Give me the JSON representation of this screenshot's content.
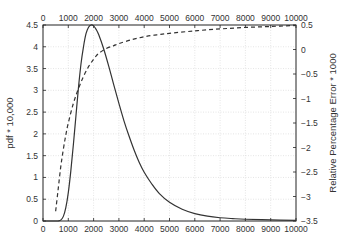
{
  "chart_data": {
    "type": "line",
    "title": "",
    "xlabel": "",
    "ylabel": "pdf * 10,000",
    "ylabel_right": "Relative Percentage Error * 1000",
    "xlim": [
      0,
      10000
    ],
    "ylim": [
      0,
      4.5
    ],
    "ylim_right": [
      -3.5,
      0.5
    ],
    "grid": true,
    "legend": null,
    "x_ticks": [
      "0",
      "1000",
      "2000",
      "3000",
      "4000",
      "5000",
      "6000",
      "7000",
      "8000",
      "9000",
      "10000"
    ],
    "x_ticks_top": [
      "0",
      "1000",
      "2000",
      "3000",
      "4000",
      "5000",
      "6000",
      "7000",
      "8000",
      "9000",
      "10000"
    ],
    "y_ticks_left": [
      "0",
      "0.5",
      "1",
      "1.5",
      "2",
      "2.5",
      "3",
      "3.5",
      "4",
      "4.5"
    ],
    "y_ticks_right": [
      "-3.5",
      "-3",
      "-2.5",
      "-2",
      "-1.5",
      "-1",
      "-0.5",
      "0",
      "0.5"
    ],
    "series": [
      {
        "name": "pdf * 10,000",
        "axis": "left",
        "style": "solid",
        "x": [
          600,
          700,
          800,
          900,
          1000,
          1100,
          1200,
          1300,
          1400,
          1500,
          1600,
          1700,
          1800,
          1900,
          2000,
          2100,
          2200,
          2400,
          2600,
          2800,
          3000,
          3200,
          3400,
          3600,
          3800,
          4000,
          4300,
          4600,
          5000,
          5500,
          6000,
          6500,
          7000,
          7500,
          8000,
          9000,
          10000
        ],
        "values": [
          0,
          0.02,
          0.1,
          0.3,
          0.65,
          1.15,
          1.75,
          2.4,
          3.05,
          3.6,
          4.0,
          4.3,
          4.45,
          4.5,
          4.48,
          4.4,
          4.28,
          3.95,
          3.55,
          3.12,
          2.7,
          2.3,
          1.95,
          1.63,
          1.35,
          1.12,
          0.85,
          0.63,
          0.43,
          0.27,
          0.17,
          0.11,
          0.075,
          0.055,
          0.04,
          0.025,
          0.015
        ]
      },
      {
        "name": "Relative Percentage Error * 1000",
        "axis": "right",
        "style": "dashed",
        "x": [
          500,
          600,
          700,
          800,
          900,
          1000,
          1200,
          1400,
          1600,
          1800,
          2000,
          2200,
          2500,
          2800,
          3000,
          3500,
          4000,
          4500,
          5000,
          6000,
          7000,
          8000,
          9000,
          10000
        ],
        "values": [
          -3.3,
          -2.85,
          -2.4,
          -2.05,
          -1.75,
          -1.5,
          -1.1,
          -0.8,
          -0.55,
          -0.35,
          -0.2,
          -0.08,
          0.02,
          0.08,
          0.12,
          0.2,
          0.26,
          0.3,
          0.33,
          0.38,
          0.42,
          0.45,
          0.47,
          0.49
        ]
      }
    ]
  }
}
